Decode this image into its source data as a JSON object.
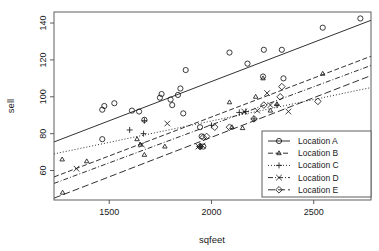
{
  "chart_data": {
    "type": "scatter",
    "title": "",
    "xlabel": "sqfeet",
    "ylabel": "sell",
    "xlim": [
      1230,
      2780
    ],
    "ylim": [
      44,
      146
    ],
    "xticks": [
      1500,
      2000,
      2500
    ],
    "yticks": [
      60,
      80,
      100,
      120,
      140
    ],
    "grid": false,
    "legend_position": "lower-right",
    "legend_entries": [
      "Location A",
      "Location B",
      "Location C",
      "Location D",
      "Location E"
    ],
    "series": [
      {
        "name": "Location A",
        "marker": "circle",
        "linestyle": "solid",
        "color": "#1a1a1a",
        "points": [
          [
            1466,
            93
          ],
          [
            1476,
            95
          ],
          [
            1466,
            77
          ],
          [
            1525,
            96.5
          ],
          [
            1611,
            92.5
          ],
          [
            1646,
            92
          ],
          [
            1672,
            87.5
          ],
          [
            1748,
            99.5
          ],
          [
            1756,
            101.5
          ],
          [
            1800,
            98.5
          ],
          [
            1808,
            95.5
          ],
          [
            1836,
            101
          ],
          [
            1848,
            104.5
          ],
          [
            1862,
            91
          ],
          [
            1874,
            114.5
          ],
          [
            1944,
            83.5
          ],
          [
            1952,
            78.5
          ],
          [
            1960,
            73
          ],
          [
            2088,
            124
          ],
          [
            2176,
            118
          ],
          [
            2256,
            125.5
          ],
          [
            2252,
            111
          ],
          [
            2344,
            125.5
          ],
          [
            2352,
            110
          ],
          [
            2544,
            137.5
          ],
          [
            2728,
            142.5
          ]
        ],
        "fit_line": {
          "x1": 1230,
          "y1": 75.5,
          "x2": 2780,
          "y2": 141.5
        }
      },
      {
        "name": "Location B",
        "marker": "triangle",
        "linestyle": "dashed",
        "color": "#1a1a1a",
        "points": [
          [
            1270,
            66
          ],
          [
            1272,
            48
          ],
          [
            1390,
            65
          ],
          [
            1636,
            77
          ],
          [
            1652,
            74
          ],
          [
            1672,
            68.5
          ],
          [
            1772,
            73
          ],
          [
            1944,
            73
          ],
          [
            2088,
            97
          ],
          [
            2100,
            83.5
          ],
          [
            2152,
            83
          ],
          [
            2216,
            100
          ],
          [
            2252,
            110
          ],
          [
            2288,
            92.5
          ],
          [
            2320,
            96
          ],
          [
            2544,
            112.5
          ]
        ],
        "fit_line": {
          "x1": 1230,
          "y1": 56.5,
          "x2": 2780,
          "y2": 122
        }
      },
      {
        "name": "Location C",
        "marker": "plus",
        "linestyle": "dotted",
        "color": "#1a1a1a",
        "points": [
          [
            1600,
            82
          ],
          [
            1668,
            80
          ],
          [
            1672,
            87
          ],
          [
            1944,
            73
          ],
          [
            2000,
            84.5
          ],
          [
            2136,
            91.5
          ],
          [
            2168,
            92
          ],
          [
            2208,
            88
          ],
          [
            2320,
            95.5
          ]
        ],
        "fit_line": {
          "x1": 1230,
          "y1": 69,
          "x2": 2780,
          "y2": 105
        }
      },
      {
        "name": "Location D",
        "marker": "cross",
        "linestyle": "dashdot",
        "color": "#1a1a1a",
        "points": [
          [
            1340,
            61
          ],
          [
            1660,
            74
          ],
          [
            1784,
            85.5
          ],
          [
            1936,
            73
          ],
          [
            1956,
            73.5
          ],
          [
            2160,
            92
          ],
          [
            2224,
            92.5
          ],
          [
            2272,
            102
          ],
          [
            2288,
            95.5
          ],
          [
            2376,
            92
          ]
        ],
        "fit_line": {
          "x1": 1230,
          "y1": 53,
          "x2": 2780,
          "y2": 117
        }
      },
      {
        "name": "Location E",
        "marker": "diamond",
        "linestyle": "longdash",
        "color": "#1a1a1a",
        "points": [
          [
            1944,
            73
          ],
          [
            1960,
            78
          ],
          [
            1976,
            78.5
          ],
          [
            2016,
            83.5
          ],
          [
            2088,
            83.5
          ],
          [
            2208,
            88
          ],
          [
            2256,
            95.5
          ],
          [
            2336,
            100
          ],
          [
            2344,
            105.5
          ],
          [
            2520,
            97.5
          ]
        ],
        "fit_line": {
          "x1": 1230,
          "y1": 45,
          "x2": 2780,
          "y2": 111.5
        }
      }
    ]
  }
}
